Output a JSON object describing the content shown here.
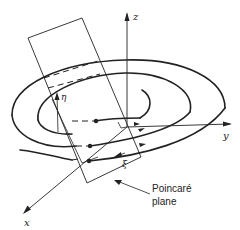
{
  "figure": {
    "axes": {
      "x_label": "x",
      "y_label": "y",
      "z_label": "z"
    },
    "plane_coords": {
      "eta_label": "η",
      "xi_label": "ξ"
    },
    "annotation": {
      "line1": "Poincaré",
      "line2": "plane"
    },
    "colors": {
      "stroke": "#222222",
      "background": "#ffffff"
    }
  }
}
